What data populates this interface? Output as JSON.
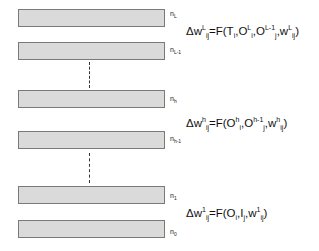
{
  "layers": [
    {
      "id": "nL",
      "base": "n",
      "sub": "L",
      "top": 9
    },
    {
      "id": "nL-1",
      "base": "n",
      "sub": "L-1",
      "top": 42
    },
    {
      "id": "nh",
      "base": "n",
      "sub": "h",
      "top": 90
    },
    {
      "id": "nh-1",
      "base": "n",
      "sub": "h-1",
      "top": 131
    },
    {
      "id": "n1",
      "base": "n",
      "sub": "1",
      "top": 186
    },
    {
      "id": "n0",
      "base": "n",
      "sub": "0",
      "top": 220
    }
  ],
  "equations": {
    "top": {
      "prefix": "Δw",
      "sup1": "L",
      "sub1": "ij",
      "body1": "=F(T",
      "sub2": "i",
      "body2": ",O",
      "sup3": "L",
      "sub3": "i",
      "body3": ",O",
      "sup4": "L-1",
      "sub4": "j",
      "body4": ",w",
      "sup5": "L",
      "sub5": "ij",
      "end": ")"
    },
    "middle": {
      "prefix": "Δw",
      "sup1": "h",
      "sub1": "ij",
      "body1": "=F(O",
      "sup2": "h",
      "sub2": "i",
      "body2": ",O",
      "sup3": "h-1",
      "sub3": "j",
      "body3": ",w",
      "sup4": "h",
      "sub4": "ij",
      "end": ")"
    },
    "bottom": {
      "prefix": "Δw",
      "sup1": "1",
      "sub1": "ij",
      "body1": "=F(O",
      "sub2": "i",
      "body2": ",I",
      "sub3": "j",
      "body3": ",w",
      "sup4": "1",
      "sub4": "ij",
      "end": ")"
    }
  }
}
